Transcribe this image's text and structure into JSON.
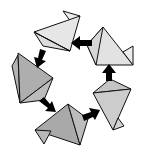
{
  "diagram": {
    "type": "cyclic-polyhedra-cycle",
    "node_count": 5,
    "arrow_count": 5,
    "direction": "counter-clockwise",
    "colors": {
      "background": "#ffffff",
      "outline": "#111111",
      "arrow": "#000000",
      "shades": [
        "#e6e6e6",
        "#dcdcdc",
        "#c8c8c8",
        "#b0b0b0",
        "#a8a8a8"
      ]
    },
    "nodes": [
      {
        "id": "top",
        "shade": "#e4e4e4"
      },
      {
        "id": "right",
        "shade": "#dedede"
      },
      {
        "id": "lower-right",
        "shade": "#c8c8c8"
      },
      {
        "id": "bottom",
        "shade": "#a9a9a9"
      },
      {
        "id": "left",
        "shade": "#b2b2b2"
      }
    ],
    "arrows": [
      {
        "from": "right",
        "to": "top"
      },
      {
        "from": "top",
        "to": "left"
      },
      {
        "from": "left",
        "to": "bottom"
      },
      {
        "from": "bottom",
        "to": "lower-right"
      },
      {
        "from": "lower-right",
        "to": "right"
      }
    ]
  }
}
